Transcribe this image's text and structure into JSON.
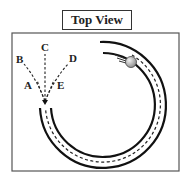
{
  "title": "Top View",
  "labels": {
    "A": "A",
    "B": "B",
    "C": "C",
    "D": "D",
    "E": "E"
  },
  "diagram": {
    "colors": {
      "line": "#222222",
      "frame": "#555555",
      "ball": "#b0b0b0"
    }
  }
}
